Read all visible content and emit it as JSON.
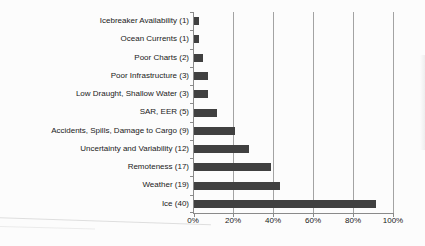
{
  "chart_data": {
    "type": "bar",
    "orientation": "horizontal",
    "title": "",
    "xlabel": "",
    "ylabel": "",
    "categories": [
      "Icebreaker Availability (1)",
      "Ocean Currents (1)",
      "Poor Charts (2)",
      "Poor Infrastructure (3)",
      "Low Draught, Shallow Water (3)",
      "SAR, EER (5)",
      "Accidents, Spills, Damage to Cargo (9)",
      "Uncertainty and Variability (12)",
      "Remoteness (17)",
      "Weather (19)",
      "Ice (40)"
    ],
    "counts": [
      1,
      1,
      2,
      3,
      3,
      5,
      9,
      12,
      17,
      19,
      40
    ],
    "values_percent": [
      2.3,
      2.3,
      4.5,
      6.8,
      6.8,
      11.4,
      20.5,
      27.3,
      38.6,
      43.2,
      90.9
    ],
    "x_ticks": [
      "0%",
      "20%",
      "40%",
      "60%",
      "80%",
      "100%"
    ],
    "xlim": [
      0,
      100
    ],
    "grid": true,
    "legend": false,
    "bar_color": "#404040",
    "gridline_color": "#a3a3a3",
    "axis_color": "#8a8a8a",
    "text_color": "#212121"
  }
}
